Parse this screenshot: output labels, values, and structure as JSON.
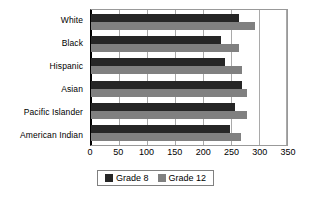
{
  "chart_data": {
    "type": "bar",
    "orientation": "horizontal",
    "title": "",
    "xlabel": "",
    "ylabel": "",
    "categories": [
      "White",
      "Black",
      "Hispanic",
      "Asian",
      "Pacific Islander",
      "American Indian"
    ],
    "series": [
      {
        "name": "Grade 8",
        "color": "#262626",
        "values": [
          265,
          233,
          239,
          270,
          257,
          249
        ]
      },
      {
        "name": "Grade 12",
        "color": "#808080",
        "values": [
          293,
          265,
          270,
          279,
          278,
          267
        ]
      }
    ],
    "xlim": [
      0,
      350
    ],
    "xticks": [
      0,
      50,
      100,
      150,
      200,
      250,
      300,
      350
    ],
    "xtick_labels": [
      "0",
      "50",
      "100",
      "150",
      "200",
      "250",
      "300",
      "350"
    ],
    "grid": true,
    "grid_axis": "x",
    "legend_position": "bottom",
    "legend_entries": [
      "Grade 8",
      "Grade 12"
    ]
  },
  "colors": {
    "grade8": "#262626",
    "grade12": "#808080",
    "gridline": "#a9a9a9",
    "axis": "#000000",
    "plot_border": "#999999",
    "legend_border": "#808080",
    "background": "#ffffff"
  }
}
